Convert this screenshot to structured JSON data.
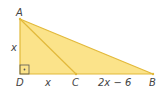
{
  "diagram": {
    "points": {
      "A": {
        "label": "A",
        "x": 20,
        "y": 19
      },
      "B": {
        "label": "B",
        "x": 153,
        "y": 74
      },
      "C": {
        "label": "C",
        "x": 76,
        "y": 74
      },
      "D": {
        "label": "D",
        "x": 20,
        "y": 74
      }
    },
    "segments": {
      "AD": "x",
      "DC": "x",
      "CB": "2x − 6"
    },
    "colors": {
      "fill": "#fbe38a",
      "stroke": "#e2b93b",
      "text": "#444444"
    },
    "right_angle_at": "D"
  }
}
